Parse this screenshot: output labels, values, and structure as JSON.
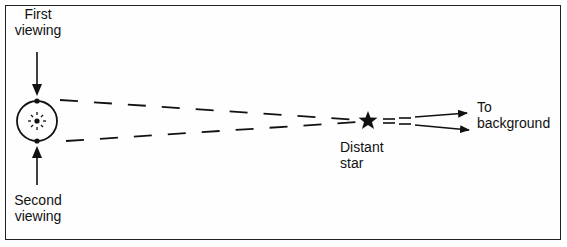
{
  "diagram": {
    "type": "parallax-illustration",
    "labels": {
      "first_viewing": [
        "First",
        "viewing"
      ],
      "second_viewing": [
        "Second",
        "viewing"
      ],
      "distant_star": [
        "Distant",
        "star"
      ],
      "to_background": [
        "To",
        "background"
      ]
    },
    "elements": {
      "earth_orbit": "circle with sun at center",
      "sun": "sun-icon",
      "star": "star-icon"
    },
    "colors": {
      "line": "#111111",
      "background": "#ffffff"
    }
  }
}
